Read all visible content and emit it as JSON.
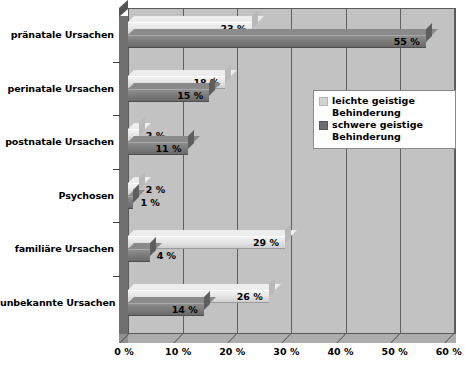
{
  "chart_data": {
    "type": "bar",
    "orientation": "horizontal",
    "title": "",
    "xlabel": "",
    "ylabel": "",
    "xlim": [
      0,
      60
    ],
    "xtick_labels": [
      "0 %",
      "10 %",
      "20 %",
      "30 %",
      "40 %",
      "50 %",
      "60 %"
    ],
    "xtick_values": [
      0,
      10,
      20,
      30,
      40,
      50,
      60
    ],
    "grid": true,
    "legend_position": "center-right",
    "categories": [
      "pränatale Ursachen",
      "perinatale Ursachen",
      "postnatale Ursachen",
      "Psychosen",
      "familiäre Ursachen",
      "unbekannte Ursachen"
    ],
    "series": [
      {
        "name": "leichte geistige Behinderung",
        "color": "#e6e6e6",
        "values": [
          23,
          18,
          2,
          2,
          29,
          26
        ],
        "value_labels": [
          "23 %",
          "18 %",
          "2 %",
          "2 %",
          "29 %",
          "26 %"
        ]
      },
      {
        "name": "schwere geistige Behinderung",
        "color": "#7c7c7c",
        "values": [
          55,
          15,
          11,
          1,
          4,
          14
        ],
        "value_labels": [
          "55 %",
          "15 %",
          "11 %",
          "1 %",
          "4 %",
          "14 %"
        ]
      }
    ]
  },
  "legend": {
    "entries": [
      {
        "label_line1": "leichte geistige",
        "label_line2": "Behinderung"
      },
      {
        "label_line1": "schwere geistige",
        "label_line2": "Behinderung"
      }
    ]
  },
  "colors": {
    "plot_background": "#c2c2c2",
    "page_background": "#ffffff",
    "gridline": "#5f5f5f",
    "series_light": "#e6e6e6",
    "series_dark": "#7c7c7c",
    "text": "#000000"
  }
}
